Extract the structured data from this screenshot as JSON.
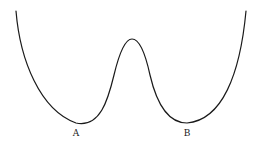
{
  "diagram": {
    "type": "double-well potential curve",
    "stroke_color": "#1a1a1a",
    "background": "#ffffff",
    "minima": [
      {
        "label": "A",
        "x": 76,
        "y": 123
      },
      {
        "label": "B",
        "x": 187,
        "y": 123
      }
    ],
    "peak": {
      "x": 132,
      "y": 39
    },
    "labels": {
      "a": "A",
      "b": "B"
    }
  }
}
